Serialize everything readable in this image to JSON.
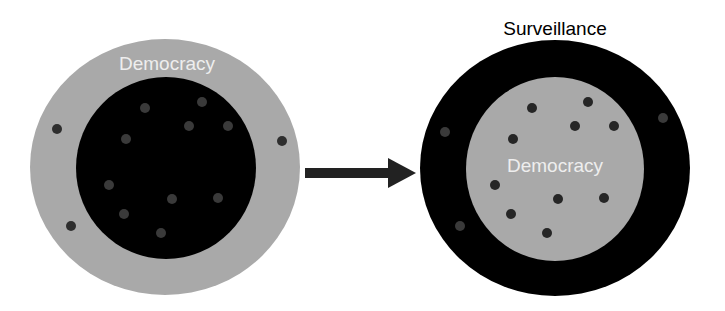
{
  "diagram": {
    "left": {
      "outer_label": "Democracy",
      "outer_color": "#a9a9a9",
      "inner_color": "#000000",
      "inner_dots_color": "#3a3a3a",
      "outer_dots_color": "#2e2e2e"
    },
    "arrow": {
      "color": "#222222",
      "direction": "right"
    },
    "right": {
      "outer_label": "Surveillance",
      "inner_label": "Democracy",
      "outer_color": "#000000",
      "inner_color": "#a9a9a9",
      "inner_dots_color": "#262626",
      "outer_dots_color": "#3a3a3a"
    }
  }
}
